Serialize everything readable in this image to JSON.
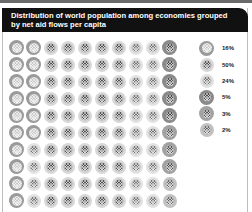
{
  "title_line1": "Distribution of world population among economies grouped",
  "title_line2": "by net aid flows per capita",
  "legend": [
    {
      "key": "c16",
      "label": "16%"
    },
    {
      "key": "c50",
      "label": "50%"
    },
    {
      "key": "c24",
      "label": "24%"
    },
    {
      "key": "c5",
      "label": "5%"
    },
    {
      "key": "c3",
      "label": "3%"
    },
    {
      "key": "c2",
      "label": "2%"
    }
  ],
  "grid": {
    "rows": 10,
    "cols": 10,
    "columns": [
      [
        "c16",
        "c16",
        "c16",
        "c16",
        "c16",
        "c16",
        "c16",
        "c16",
        "c16",
        "c16"
      ],
      [
        "c16",
        "c16",
        "c16",
        "c16",
        "c16",
        "c16",
        "c24",
        "c24",
        "c24",
        "c24"
      ],
      [
        "c50",
        "c50",
        "c50",
        "c50",
        "c50",
        "c50",
        "c50",
        "c50",
        "c50",
        "c50"
      ],
      [
        "c50",
        "c50",
        "c50",
        "c50",
        "c50",
        "c50",
        "c50",
        "c50",
        "c50",
        "c50"
      ],
      [
        "c50",
        "c50",
        "c50",
        "c50",
        "c50",
        "c50",
        "c50",
        "c50",
        "c50",
        "c50"
      ],
      [
        "c50",
        "c50",
        "c50",
        "c50",
        "c50",
        "c50",
        "c50",
        "c50",
        "c50",
        "c50"
      ],
      [
        "c50",
        "c50",
        "c50",
        "c50",
        "c50",
        "c50",
        "c50",
        "c50",
        "c50",
        "c50"
      ],
      [
        "c24",
        "c24",
        "c24",
        "c24",
        "c24",
        "c24",
        "c24",
        "c24",
        "c24",
        "c24"
      ],
      [
        "c24",
        "c24",
        "c24",
        "c24",
        "c24",
        "c24",
        "c24",
        "c24",
        "c24",
        "c24"
      ],
      [
        "c5",
        "c5",
        "c5",
        "c5",
        "c5",
        "c3",
        "c3",
        "c3",
        "c2",
        "c2"
      ]
    ]
  },
  "chart_data": {
    "type": "waffle",
    "title": "Distribution of world population among economies grouped by net aid flows per capita",
    "units": "percent of world population (each symbol = 1%)",
    "categories": [
      "Group 1",
      "Group 2",
      "Group 3",
      "Group 4",
      "Group 5",
      "Group 6"
    ],
    "values": [
      16,
      50,
      24,
      5,
      3,
      2
    ],
    "legend_labels": [
      "16%",
      "50%",
      "24%",
      "5%",
      "3%",
      "2%"
    ],
    "grid_size": [
      10,
      10
    ],
    "legend_position": "right",
    "xlabel": "",
    "ylabel": ""
  }
}
